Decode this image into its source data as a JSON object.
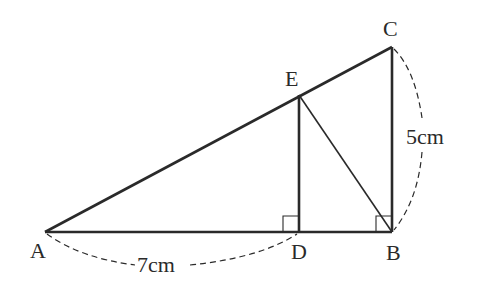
{
  "diagram": {
    "points": {
      "A": {
        "label": "A",
        "x": 45,
        "y": 232
      },
      "B": {
        "label": "B",
        "x": 392,
        "y": 232
      },
      "C": {
        "label": "C",
        "x": 392,
        "y": 47
      },
      "D": {
        "label": "D",
        "x": 299,
        "y": 232
      },
      "E": {
        "label": "E",
        "x": 299,
        "y": 95
      }
    },
    "measurements": {
      "AD": "7cm",
      "BC": "5cm"
    },
    "colors": {
      "stroke": "#2a2a2a",
      "background": "#ffffff"
    }
  }
}
